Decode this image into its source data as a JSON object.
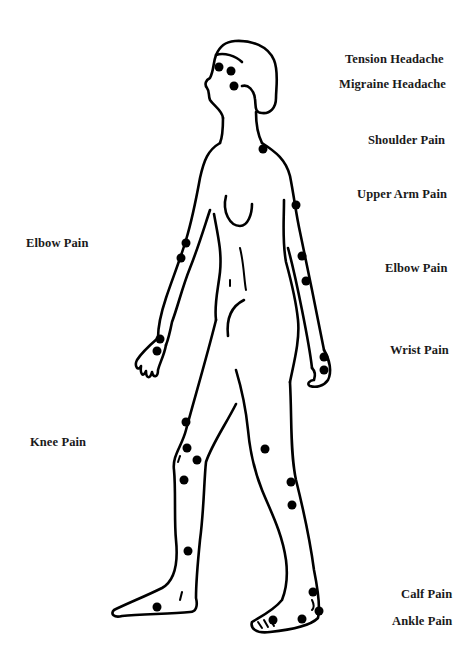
{
  "diagram": {
    "dot_color": "#000000",
    "line_color": "#000000",
    "background": "#ffffff"
  },
  "labels": {
    "tension_headache": "Tension Headache",
    "migraine_headache": "Migraine Headache",
    "shoulder_pain": "Shoulder Pain",
    "upper_arm_pain": "Upper Arm Pain",
    "elbow_pain_left": "Elbow Pain",
    "elbow_pain_right": "Elbow Pain",
    "wrist_pain": "Wrist Pain",
    "knee_pain": "Knee Pain",
    "calf_pain": "Calf Pain",
    "ankle_pain": "Ankle Pain"
  },
  "points": [
    {
      "region": "head",
      "x": 219,
      "y": 67
    },
    {
      "region": "head",
      "x": 231,
      "y": 71
    },
    {
      "region": "head",
      "x": 234,
      "y": 86
    },
    {
      "region": "shoulder",
      "x": 263,
      "y": 149
    },
    {
      "region": "upper-arm",
      "x": 296,
      "y": 205
    },
    {
      "region": "elbow-right",
      "x": 302,
      "y": 256
    },
    {
      "region": "elbow-right",
      "x": 306,
      "y": 281
    },
    {
      "region": "elbow-left",
      "x": 186,
      "y": 243
    },
    {
      "region": "elbow-left",
      "x": 181,
      "y": 258
    },
    {
      "region": "wrist-left",
      "x": 160,
      "y": 339
    },
    {
      "region": "wrist-left",
      "x": 157,
      "y": 351
    },
    {
      "region": "wrist-right",
      "x": 324,
      "y": 357
    },
    {
      "region": "wrist-right",
      "x": 324,
      "y": 370
    },
    {
      "region": "knee",
      "x": 186,
      "y": 422
    },
    {
      "region": "knee",
      "x": 187,
      "y": 448
    },
    {
      "region": "knee",
      "x": 197,
      "y": 460
    },
    {
      "region": "knee",
      "x": 184,
      "y": 480
    },
    {
      "region": "knee-back",
      "x": 265,
      "y": 449
    },
    {
      "region": "calf",
      "x": 291,
      "y": 482
    },
    {
      "region": "calf",
      "x": 292,
      "y": 505
    },
    {
      "region": "shin",
      "x": 188,
      "y": 551
    },
    {
      "region": "ankle-left",
      "x": 157,
      "y": 607
    },
    {
      "region": "calf-ankle",
      "x": 313,
      "y": 592
    },
    {
      "region": "ankle-right",
      "x": 319,
      "y": 611
    },
    {
      "region": "ankle-right",
      "x": 302,
      "y": 619
    },
    {
      "region": "ankle-right",
      "x": 273,
      "y": 620
    }
  ]
}
